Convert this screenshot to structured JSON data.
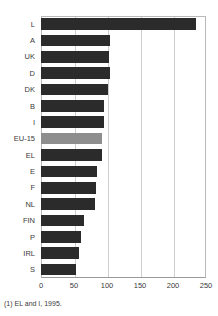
{
  "chart_data": {
    "type": "bar",
    "orientation": "horizontal",
    "title": "",
    "xlabel": "",
    "ylabel": "",
    "xlim": [
      0,
      250
    ],
    "xticks": [
      0,
      50,
      100,
      150,
      200,
      250
    ],
    "grid": true,
    "legend": "none",
    "categories": [
      "L",
      "A",
      "UK",
      "D",
      "DK",
      "B",
      "I",
      "EU-15",
      "EL",
      "E",
      "F",
      "NL",
      "FIN",
      "P",
      "IRL",
      "S"
    ],
    "values": [
      235,
      105,
      103,
      105,
      102,
      96,
      95,
      92,
      93,
      85,
      83,
      82,
      65,
      61,
      57,
      53
    ],
    "highlight_category": "EU-15",
    "colors": {
      "bar": "#2b2b2b",
      "highlight_bar": "#8e8e8e",
      "gridline": "#cfcfcf",
      "axis": "#9a9a9a",
      "text": "#3a3a3a",
      "background": "#ffffff"
    }
  },
  "footnote": {
    "text": "(1) EL and I, 1995."
  }
}
